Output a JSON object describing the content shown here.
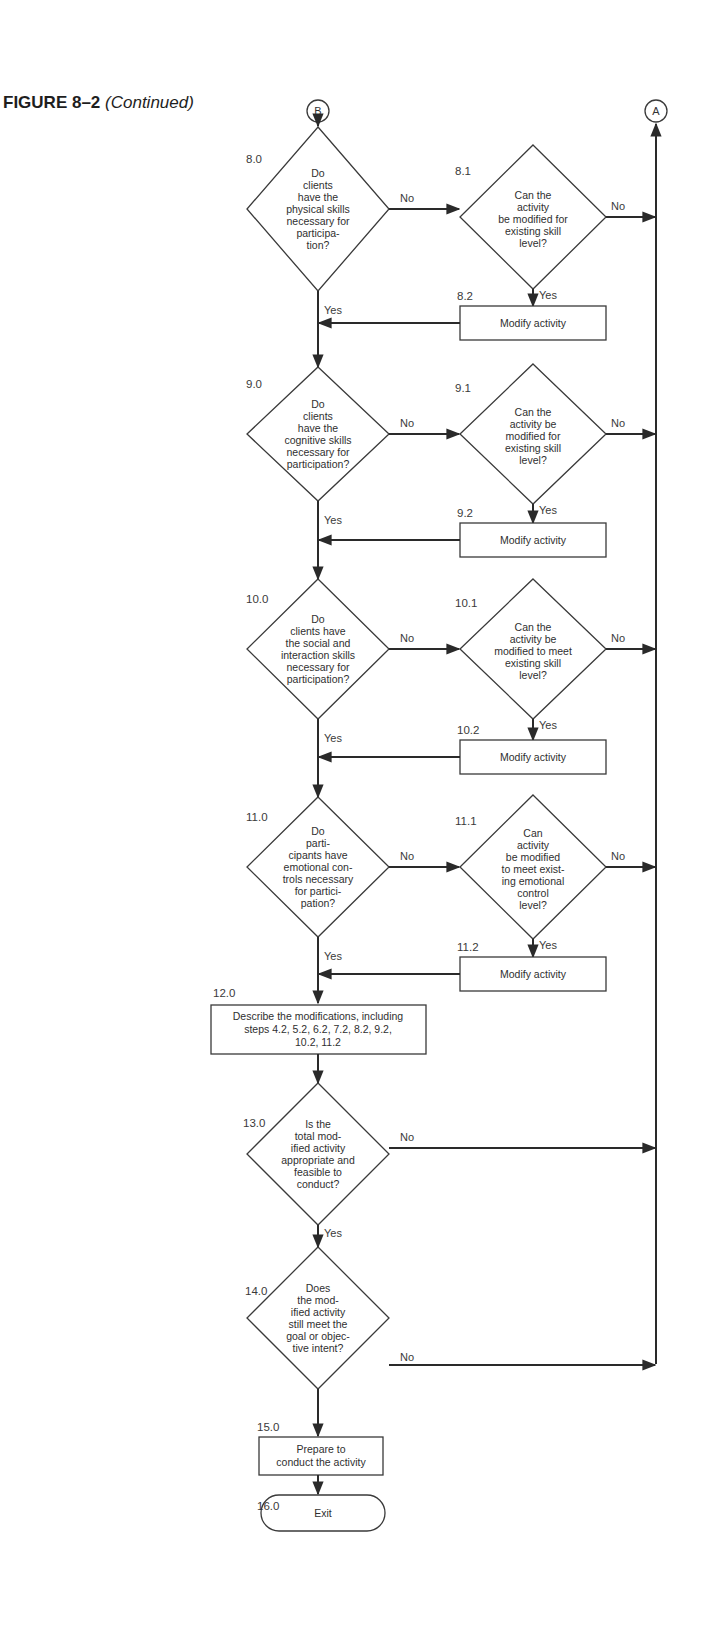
{
  "figure": {
    "number": "FIGURE 8–2",
    "subtitle": "(Continued)"
  },
  "connectors": {
    "in": "B",
    "out": "A"
  },
  "labels": {
    "yes": "Yes",
    "no": "No"
  },
  "decisions": [
    {
      "id": "8.0",
      "lines": [
        "Do",
        "clients",
        "have the",
        "physical skills",
        "necessary for",
        "participa-",
        "tion?"
      ],
      "alt": {
        "id": "8.1",
        "lines": [
          "Can the",
          "activity",
          "be modified for",
          "existing skill",
          "level?"
        ]
      },
      "modify": {
        "id": "8.2",
        "label": "Modify activity"
      }
    },
    {
      "id": "9.0",
      "lines": [
        "Do",
        "clients",
        "have the",
        "cognitive skills",
        "necessary for",
        "participation?"
      ],
      "alt": {
        "id": "9.1",
        "lines": [
          "Can the",
          "activity be",
          "modified for",
          "existing skill",
          "level?"
        ]
      },
      "modify": {
        "id": "9.2",
        "label": "Modify activity"
      }
    },
    {
      "id": "10.0",
      "lines": [
        "Do",
        "clients have",
        "the social and",
        "interaction skills",
        "necessary for",
        "participation?"
      ],
      "alt": {
        "id": "10.1",
        "lines": [
          "Can the",
          "activity be",
          "modified to meet",
          "existing skill",
          "level?"
        ]
      },
      "modify": {
        "id": "10.2",
        "label": "Modify activity"
      }
    },
    {
      "id": "11.0",
      "lines": [
        "Do",
        "parti-",
        "cipants have",
        "emotional con-",
        "trols necessary",
        "for partici-",
        "pation?"
      ],
      "alt": {
        "id": "11.1",
        "lines": [
          "Can",
          "activity",
          "be modified",
          "to meet exist-",
          "ing emotional",
          "control",
          "level?"
        ]
      },
      "modify": {
        "id": "11.2",
        "label": "Modify activity"
      }
    }
  ],
  "step12": {
    "id": "12.0",
    "lines": [
      "Describe the modifications, including",
      "steps 4.2, 5.2, 6.2, 7.2, 8.2, 9.2,",
      "10.2, 11.2"
    ]
  },
  "step13": {
    "id": "13.0",
    "lines": [
      "Is the",
      "total mod-",
      "ified activity",
      "appropriate and",
      "feasible to",
      "conduct?"
    ]
  },
  "step14": {
    "id": "14.0",
    "lines": [
      "Does",
      "the mod-",
      "ified activity",
      "still meet the",
      "goal or objec-",
      "tive intent?"
    ]
  },
  "step15": {
    "id": "15.0",
    "lines": [
      "Prepare to",
      "conduct the activity"
    ]
  },
  "step16": {
    "id": "16.0",
    "label": "Exit"
  }
}
